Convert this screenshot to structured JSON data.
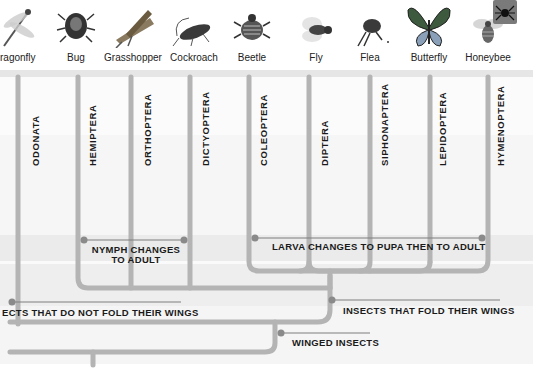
{
  "insects": [
    {
      "name": "Dragonfly",
      "display": "ragonfly",
      "x": 0,
      "icon": "dragonfly-icon"
    },
    {
      "name": "Bug",
      "display": "Bug",
      "x": 46,
      "icon": "bug-icon"
    },
    {
      "name": "Grasshopper",
      "display": "Grasshopper",
      "x": 103,
      "icon": "grasshopper-icon"
    },
    {
      "name": "Cockroach",
      "display": "Cockroach",
      "x": 164,
      "icon": "cockroach-icon"
    },
    {
      "name": "Beetle",
      "display": "Beetle",
      "x": 222,
      "icon": "beetle-icon"
    },
    {
      "name": "Fly",
      "display": "Fly",
      "x": 286,
      "icon": "fly-icon"
    },
    {
      "name": "Flea",
      "display": "Flea",
      "x": 340,
      "icon": "flea-icon"
    },
    {
      "name": "Butterfly",
      "display": "Butterfly",
      "x": 399,
      "icon": "butterfly-icon"
    },
    {
      "name": "Honeybee",
      "display": "Honeybee",
      "x": 458,
      "icon": "honeybee-icon"
    }
  ],
  "orders": [
    {
      "name": "ODONATA",
      "x": 29
    },
    {
      "name": "HEMIPTERA",
      "x": 86
    },
    {
      "name": "ORTHOPTERA",
      "x": 141
    },
    {
      "name": "DICTYOPTERA",
      "x": 199
    },
    {
      "name": "COLEOPTERA",
      "x": 257
    },
    {
      "name": "DIPTERA",
      "x": 318
    },
    {
      "name": "SIPHONAPTERA",
      "x": 378
    },
    {
      "name": "LEPIDOPTERA",
      "x": 436
    },
    {
      "name": "HYMENOPTERA",
      "x": 494
    }
  ],
  "groups": {
    "nymph": {
      "line1": "NYMPH CHANGES",
      "line2": "TO ADULT"
    },
    "larva": "LARVA CHANGES TO PUPA THEN TO ADULT",
    "no_fold": "ECTS THAT DO NOT FOLD THEIR WINGS",
    "fold": "INSECTS THAT FOLD THEIR WINGS",
    "winged": "WINGED INSECTS"
  },
  "colors": {
    "branch": "#b4b4b4",
    "node": "#8a8a8a",
    "band_light": "#f4f4f4",
    "band_mid": "#ebebeb",
    "text": "#1a1a1a"
  }
}
